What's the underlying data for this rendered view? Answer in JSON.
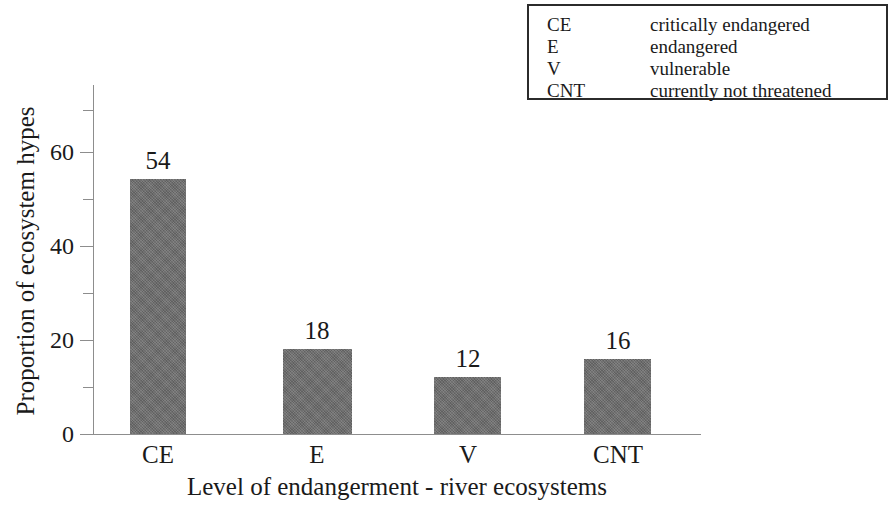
{
  "chart_data": {
    "type": "bar",
    "title": "",
    "categories": [
      "CE",
      "E",
      "V",
      "CNT"
    ],
    "values": [
      54,
      18,
      12,
      16
    ],
    "series": [
      {
        "name": "Proportion of ecosystem hypes",
        "values": [
          54,
          18,
          12,
          16
        ]
      }
    ],
    "xlabel": "Level of endangerment - river ecosystems",
    "ylabel": "Proportion of ecosystem hypes",
    "ylim": [
      0,
      74
    ],
    "y_major_ticks": [
      0,
      20,
      40,
      60
    ],
    "y_minor_ticks": [
      10,
      30,
      50,
      70
    ],
    "y_tick_labels": [
      "0",
      "20",
      "40",
      "60"
    ],
    "grid": false,
    "legend_position": "top-right",
    "bar_color": "#6d6d6d",
    "axis_color": "#8d8d8d",
    "text_color": "#1a1a1a",
    "data_labels": [
      "54",
      "18",
      "12",
      "16"
    ],
    "legend_entries": [
      {
        "abbr": "CE",
        "description": "critically endangered"
      },
      {
        "abbr": "E",
        "description": "endangered"
      },
      {
        "abbr": "V",
        "description": "vulnerable"
      },
      {
        "abbr": "CNT",
        "description": "currently not threatened"
      }
    ]
  }
}
